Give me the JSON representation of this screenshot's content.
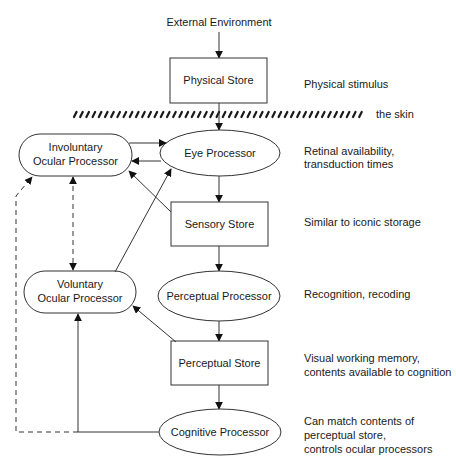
{
  "diagram": {
    "type": "flow",
    "top_input": "External Environment",
    "skin_label": "the skin",
    "nodes": {
      "physical_store": {
        "label": "Physical Store",
        "shape": "rect"
      },
      "eye_processor": {
        "label": "Eye Processor",
        "shape": "ellipse"
      },
      "sensory_store": {
        "label": "Sensory Store",
        "shape": "rect"
      },
      "perceptual_processor": {
        "label": "Perceptual Processor",
        "shape": "ellipse"
      },
      "perceptual_store": {
        "label": "Perceptual Store",
        "shape": "rect"
      },
      "cognitive_processor": {
        "label": "Cognitive Processor",
        "shape": "ellipse"
      },
      "involuntary_ocular": {
        "line1": "Involuntary",
        "line2": "Ocular Processor",
        "shape": "rounded"
      },
      "voluntary_ocular": {
        "line1": "Voluntary",
        "line2": "Ocular Processor",
        "shape": "rounded"
      }
    },
    "annotations": {
      "physical_store": [
        "Physical stimulus"
      ],
      "eye_processor": [
        "Retinal availability,",
        "transduction times"
      ],
      "sensory_store": [
        "Similar to iconic storage"
      ],
      "perceptual_processor": [
        "Recognition, recoding"
      ],
      "perceptual_store": [
        "Visual working memory,",
        "contents available to cognition"
      ],
      "cognitive_processor": [
        "Can match contents of",
        "perceptual store,",
        "controls ocular processors"
      ]
    },
    "edges": [
      {
        "from": "External Environment",
        "to": "Physical Store",
        "style": "solid"
      },
      {
        "from": "Physical Store",
        "to": "Eye Processor",
        "style": "solid"
      },
      {
        "from": "Eye Processor",
        "to": "Sensory Store",
        "style": "solid"
      },
      {
        "from": "Sensory Store",
        "to": "Perceptual Processor",
        "style": "solid"
      },
      {
        "from": "Perceptual Processor",
        "to": "Perceptual Store",
        "style": "solid"
      },
      {
        "from": "Perceptual Store",
        "to": "Cognitive Processor",
        "style": "solid"
      },
      {
        "from": "Involuntary Ocular Processor",
        "to": "Eye Processor",
        "style": "solid"
      },
      {
        "from": "Eye Processor",
        "to": "Involuntary Ocular Processor",
        "style": "solid"
      },
      {
        "from": "Sensory Store",
        "to": "Involuntary Ocular Processor",
        "style": "solid"
      },
      {
        "from": "Voluntary Ocular Processor",
        "to": "Eye Processor",
        "style": "solid"
      },
      {
        "from": "Perceptual Store",
        "to": "Voluntary Ocular Processor",
        "style": "solid"
      },
      {
        "from": "Cognitive Processor",
        "to": "Voluntary Ocular Processor",
        "style": "solid"
      },
      {
        "from": "Cognitive Processor",
        "to": "Involuntary Ocular Processor",
        "style": "dashed"
      },
      {
        "from": "Involuntary Ocular Processor",
        "to": "Voluntary Ocular Processor",
        "style": "dashed-bidirectional"
      }
    ]
  }
}
